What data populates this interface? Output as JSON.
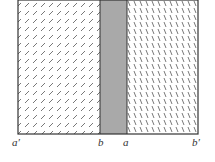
{
  "diagram": {
    "regions": [
      {
        "name": "left-region",
        "fill": "hatched-forward"
      },
      {
        "name": "middle-band",
        "fill": "gray",
        "color": "#a9a9a9"
      },
      {
        "name": "right-region",
        "fill": "hatched-backward"
      }
    ],
    "labels": {
      "a_prime": "a′",
      "b": "b",
      "a": "a",
      "b_prime": "b′"
    },
    "colors": {
      "border": "#333333",
      "hatch": "#444444",
      "band": "#a9a9a9",
      "background": "#ffffff"
    }
  }
}
